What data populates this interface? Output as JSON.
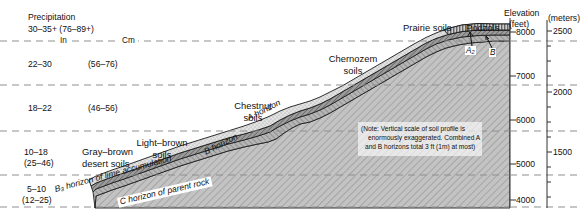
{
  "precipitation": {
    "heading_line1": "Precipitation",
    "heading_line2": "30–35+ (76–89+)",
    "unit_inches": "In",
    "unit_cm": "Cm",
    "bands": [
      {
        "inches": "22–30",
        "cm": "(56–76)"
      },
      {
        "inches": "18–22",
        "cm": "(46–56)"
      },
      {
        "inches": "10–18",
        "cm": "(25–46)",
        "soil_line1": "Gray–brown",
        "soil_line2": "desert soils"
      },
      {
        "inches": "5–10",
        "cm": "(12–25)"
      }
    ]
  },
  "elevation": {
    "label_line1": "Elevation",
    "label_line2": "(feet)",
    "meters_label": "(meters)",
    "feet_ticks": [
      "8000",
      "7000",
      "6000",
      "5000",
      "4000"
    ],
    "meters_ticks": [
      "2500",
      "2000",
      "1500"
    ]
  },
  "soil_zones": [
    {
      "name": "light-brown-soils",
      "line1": "Light–brown",
      "line2": "soils"
    },
    {
      "name": "chestnut-soils",
      "line1": "Chestnut",
      "line2": "soils"
    },
    {
      "name": "chernozem-soils",
      "line1": "Chernozem",
      "line2": "soils"
    },
    {
      "name": "prairie-soils",
      "line1": "Prairie soils"
    },
    {
      "name": "podzols",
      "line1": "Podzols"
    }
  ],
  "horizons": {
    "a_horizon": "A horizon",
    "b_horizon": "B horizon",
    "b3_horizon": "B₃ horizon of lime accumulation",
    "c_horizon": "C horizon of parent rock",
    "a2_callout": "A₂",
    "b_callout": "B"
  },
  "note": {
    "line1": "(Note: Vertical scale of soil profile is",
    "line2": "enormously exaggerated. Combined A",
    "line3": "and B horizons total 3 ft (1m) at most)"
  },
  "colors": {
    "bedrock": "#b9b9b9",
    "b3_layer": "#9a9a9a",
    "b_layer": "#8a8a8a",
    "a_layer": "#d8d8d8",
    "outline": "#1a1a1a",
    "dashed": "#8f8f8f"
  }
}
